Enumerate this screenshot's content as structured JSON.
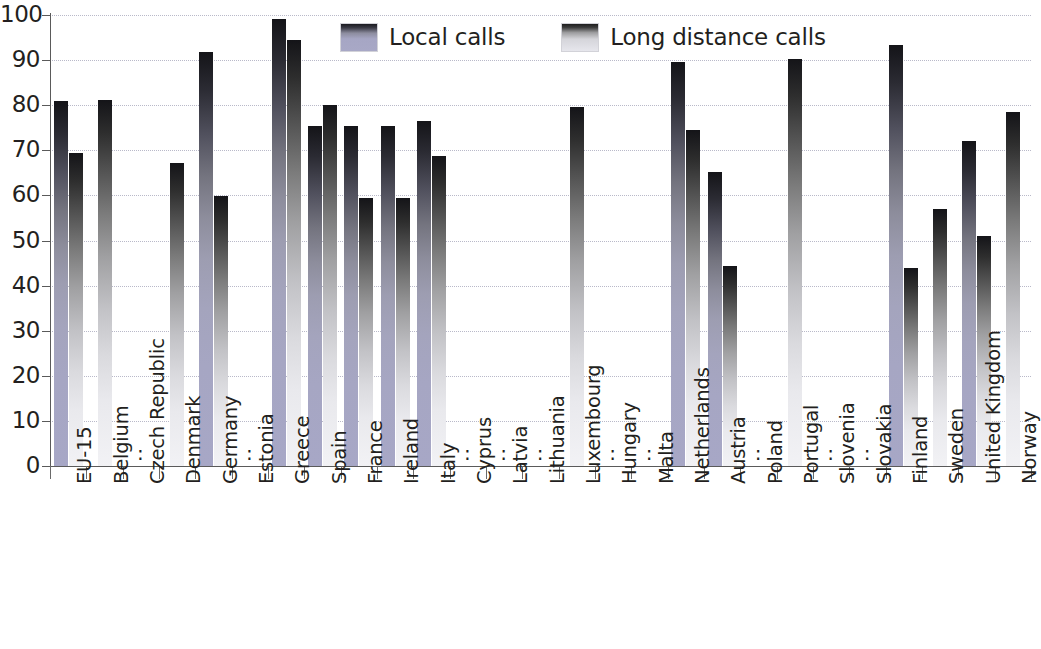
{
  "chart_data": {
    "type": "bar",
    "title": "",
    "xlabel": "",
    "ylabel": "",
    "ylim": [
      0,
      100
    ],
    "ytick_values": [
      0,
      10,
      20,
      30,
      40,
      50,
      60,
      70,
      80,
      90,
      100
    ],
    "ytick_labels": [
      "0",
      "10",
      "20",
      "30",
      "40",
      "50",
      "60",
      "70",
      "80",
      "90",
      "100"
    ],
    "grid": true,
    "legend_position": "top-center",
    "missing_value_symbol": ":",
    "categories": [
      "EU-15",
      "Belgium",
      "Czech Republic",
      "Denmark",
      "Germany",
      "Estonia",
      "Greece",
      "Spain",
      "France",
      "Ireland",
      "Italy",
      "Cyprus",
      "Latvia",
      "Lithuania",
      "Luxembourg",
      "Hungary",
      "Malta",
      "Netherlands",
      "Austria",
      "Poland",
      "Portugal",
      "Slovenia",
      "Slovakia",
      "Finland",
      "Sweden",
      "United Kingdom",
      "Norway"
    ],
    "series": [
      {
        "name": "Local calls",
        "color": "#a6a6c4",
        "values": [
          81.0,
          null,
          null,
          null,
          91.7,
          null,
          99.2,
          75.5,
          75.3,
          75.3,
          76.5,
          null,
          null,
          null,
          null,
          null,
          null,
          89.6,
          65.3,
          null,
          null,
          null,
          null,
          93.3,
          null,
          72.0,
          null
        ]
      },
      {
        "name": "Long distance calls",
        "color": "#e2e2e8",
        "values": [
          69.4,
          81.2,
          null,
          67.2,
          59.8,
          null,
          94.5,
          80.0,
          59.4,
          59.4,
          68.8,
          null,
          null,
          null,
          79.5,
          null,
          null,
          74.5,
          44.3,
          null,
          90.3,
          null,
          null,
          43.8,
          57.0,
          51.0,
          78.5
        ]
      }
    ],
    "missing_categories": [
      "Czech Republic",
      "Estonia",
      "Cyprus",
      "Latvia",
      "Lithuania",
      "Hungary",
      "Malta",
      "Poland",
      "Slovenia",
      "Slovakia"
    ]
  },
  "legend": {
    "items": [
      {
        "label": "Local calls",
        "key": "local"
      },
      {
        "label": "Long distance calls",
        "key": "ld"
      }
    ]
  }
}
